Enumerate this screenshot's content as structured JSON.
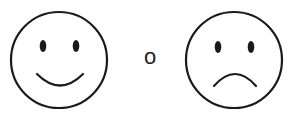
{
  "faces": [
    {
      "label": "happy",
      "expression": "smile"
    },
    {
      "label": "sad",
      "expression": "frown"
    }
  ],
  "separator": "o",
  "colors": {
    "stroke": "#1a1a1a",
    "background": "#ffffff"
  }
}
